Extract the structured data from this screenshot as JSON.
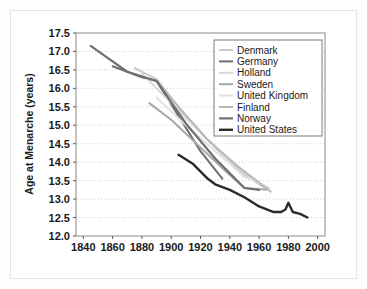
{
  "chart_data": {
    "type": "line",
    "title": "",
    "xlabel": "",
    "ylabel": "Age at Menarche (years)",
    "xlim": [
      1835,
      2005
    ],
    "ylim": [
      12.0,
      17.5
    ],
    "xticks": [
      1840,
      1860,
      1880,
      1900,
      1920,
      1940,
      1960,
      1980,
      2000
    ],
    "xtick_labels": [
      "1840",
      "1860",
      "1880",
      "1900",
      "1920",
      "1940",
      "1960",
      "1980",
      "2000"
    ],
    "yticks": [
      12.0,
      12.5,
      13.0,
      13.5,
      14.0,
      14.5,
      15.0,
      15.5,
      16.0,
      16.5,
      17.0,
      17.5
    ],
    "ytick_labels": [
      "12.0",
      "12.5",
      "13.0",
      "13.5",
      "14.0",
      "14.5",
      "15.0",
      "15.5",
      "16.0",
      "16.5",
      "17.0",
      "17.5"
    ],
    "grid": true,
    "grid_axis": "y",
    "legend_position": "upper right",
    "series": [
      {
        "name": "Denmark",
        "color": "#c9c9c9",
        "width": 2.0,
        "x": [
          1875,
          1890,
          1910,
          1930,
          1950,
          1964
        ],
        "y": [
          16.55,
          16.25,
          15.25,
          14.4,
          13.65,
          13.3
        ]
      },
      {
        "name": "Germany",
        "color": "#6e6e6e",
        "width": 2.0,
        "x": [
          1860,
          1880,
          1890,
          1920,
          1935
        ],
        "y": [
          16.6,
          16.3,
          16.2,
          14.3,
          13.55
        ]
      },
      {
        "name": "Holland",
        "color": "#d8d8d8",
        "width": 2.0,
        "x": [
          1880,
          1900,
          1920,
          1940,
          1955,
          1967
        ],
        "y": [
          16.4,
          15.6,
          14.8,
          14.05,
          13.55,
          13.3
        ]
      },
      {
        "name": "Sweden",
        "color": "#a8a8a8",
        "width": 2.0,
        "x": [
          1885,
          1900,
          1920,
          1940,
          1950,
          1966
        ],
        "y": [
          15.6,
          15.15,
          14.4,
          13.65,
          13.3,
          13.25
        ]
      },
      {
        "name": "United Kingdom",
        "color": "#e2e2e2",
        "width": 2.0,
        "x": [
          1890,
          1910,
          1930,
          1950,
          1965
        ],
        "y": [
          15.75,
          15.0,
          14.3,
          13.6,
          13.35
        ]
      },
      {
        "name": "Finland",
        "color": "#b8b8b8",
        "width": 2.0,
        "x": [
          1890,
          1905,
          1925,
          1945,
          1960,
          1968
        ],
        "y": [
          16.2,
          15.5,
          14.6,
          13.9,
          13.45,
          13.2
        ]
      },
      {
        "name": "Norway",
        "color": "#707070",
        "width": 2.2,
        "x": [
          1845,
          1870,
          1890,
          1910,
          1930,
          1950,
          1960
        ],
        "y": [
          17.15,
          16.45,
          16.2,
          15.05,
          14.1,
          13.3,
          13.25
        ]
      },
      {
        "name": "United States",
        "color": "#2b2b2b",
        "width": 2.4,
        "x": [
          1905,
          1915,
          1925,
          1930,
          1940,
          1950,
          1960,
          1970,
          1975,
          1978,
          1980,
          1983,
          1988,
          1993
        ],
        "y": [
          14.2,
          13.95,
          13.55,
          13.4,
          13.25,
          13.05,
          12.8,
          12.65,
          12.65,
          12.72,
          12.9,
          12.65,
          12.6,
          12.5
        ]
      }
    ]
  },
  "legend": {
    "items": [
      {
        "label": "Denmark"
      },
      {
        "label": "Germany"
      },
      {
        "label": "Holland"
      },
      {
        "label": "Sweden"
      },
      {
        "label": "United Kingdom"
      },
      {
        "label": "Finland"
      },
      {
        "label": "Norway"
      },
      {
        "label": "United States"
      }
    ]
  }
}
